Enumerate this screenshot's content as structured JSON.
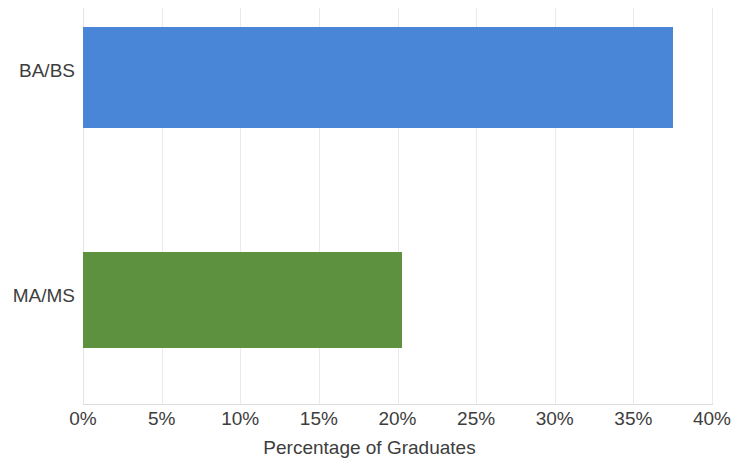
{
  "chart_data": {
    "type": "bar",
    "orientation": "horizontal",
    "title": "",
    "subtitle": "",
    "categories": [
      "BA/BS",
      "MA/MS"
    ],
    "values": [
      37.5,
      20.3
    ],
    "value_suffix": "%",
    "series": [
      {
        "name": "Percentage of Graduates",
        "values": [
          37.5,
          20.3
        ],
        "colors": [
          "#4a86d8",
          "#5d9140"
        ]
      }
    ],
    "xlabel": "Percentage of Graduates",
    "ylabel": "",
    "xlim": [
      0,
      40
    ],
    "ylim": [
      0,
      2
    ],
    "xticks": [
      0,
      5,
      10,
      15,
      20,
      25,
      30,
      35,
      40
    ],
    "xtick_labels": [
      "0%",
      "5%",
      "10%",
      "15%",
      "20%",
      "25%",
      "30%",
      "35%",
      "40%"
    ],
    "grid": true,
    "grid_axis": "x",
    "grid_color": "#e9eaec",
    "legend": false,
    "legend_position": "none",
    "background": "#ffffff",
    "annotations": []
  },
  "colors": {
    "bar_ba_bs": "#4a86d8",
    "bar_ma_ms": "#5d9140",
    "gridline": "#e9eaec",
    "baseline": "#dcdddf",
    "text": "#3d3d3d"
  },
  "axis": {
    "x_title": "Percentage of Graduates"
  },
  "bars": [
    {
      "label": "BA/BS",
      "value": 37.5,
      "display": "37.5%",
      "color": "#4a86d8"
    },
    {
      "label": "MA/MS",
      "value": 20.3,
      "display": "20.3%",
      "color": "#5d9140"
    }
  ],
  "ticks": [
    {
      "label": "0%",
      "value": 0
    },
    {
      "label": "5%",
      "value": 5
    },
    {
      "label": "10%",
      "value": 10
    },
    {
      "label": "15%",
      "value": 15
    },
    {
      "label": "20%",
      "value": 20
    },
    {
      "label": "25%",
      "value": 25
    },
    {
      "label": "30%",
      "value": 30
    },
    {
      "label": "35%",
      "value": 35
    },
    {
      "label": "40%",
      "value": 40
    }
  ]
}
